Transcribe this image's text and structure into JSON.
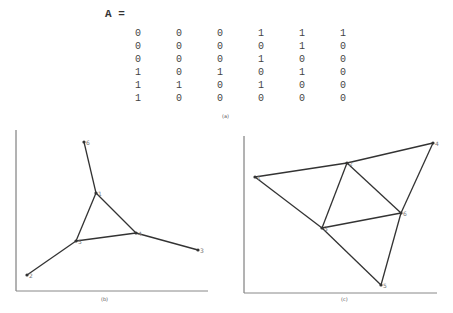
{
  "matrix": {
    "label": "A =",
    "rows": [
      [
        "0",
        "0",
        "0",
        "1",
        "1",
        "1"
      ],
      [
        "0",
        "0",
        "0",
        "0",
        "1",
        "0"
      ],
      [
        "0",
        "0",
        "0",
        "1",
        "0",
        "0"
      ],
      [
        "1",
        "0",
        "1",
        "0",
        "1",
        "0"
      ],
      [
        "1",
        "1",
        "0",
        "1",
        "0",
        "0"
      ],
      [
        "1",
        "0",
        "0",
        "0",
        "0",
        "0"
      ]
    ],
    "caption": "(a)"
  },
  "graph_b": {
    "caption": "(b)",
    "nodes": [
      {
        "id": "6",
        "x": 84,
        "y": 142
      },
      {
        "id": "1",
        "x": 96,
        "y": 193
      },
      {
        "id": "5",
        "x": 76,
        "y": 241
      },
      {
        "id": "4",
        "x": 136,
        "y": 233
      },
      {
        "id": "3",
        "x": 198,
        "y": 250
      },
      {
        "id": "2",
        "x": 27,
        "y": 275
      }
    ],
    "edges": [
      [
        "6",
        "1"
      ],
      [
        "1",
        "5"
      ],
      [
        "1",
        "4"
      ],
      [
        "5",
        "4"
      ],
      [
        "5",
        "2"
      ],
      [
        "4",
        "3"
      ]
    ]
  },
  "graph_c": {
    "caption": "(c)",
    "nodes": [
      {
        "id": "1",
        "x": 255,
        "y": 177
      },
      {
        "id": "2",
        "x": 347,
        "y": 163
      },
      {
        "id": "4",
        "x": 433,
        "y": 143
      },
      {
        "id": "3",
        "x": 322,
        "y": 228
      },
      {
        "id": "6",
        "x": 401,
        "y": 213
      },
      {
        "id": "5",
        "x": 381,
        "y": 285
      }
    ],
    "edges": [
      [
        "1",
        "2"
      ],
      [
        "2",
        "4"
      ],
      [
        "1",
        "3"
      ],
      [
        "3",
        "5"
      ],
      [
        "2",
        "3"
      ],
      [
        "2",
        "6"
      ],
      [
        "3",
        "6"
      ],
      [
        "4",
        "6"
      ],
      [
        "6",
        "5"
      ]
    ]
  }
}
